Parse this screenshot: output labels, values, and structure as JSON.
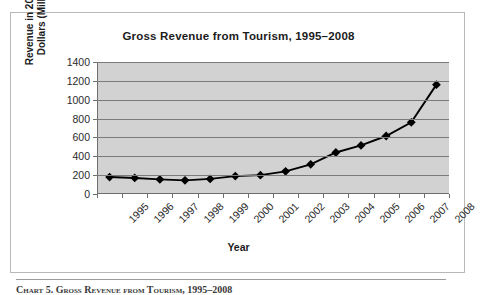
{
  "figure": {
    "title": "Gross Revenue from Tourism, 1995–2008",
    "x_axis_title": "Year",
    "y_axis_title_line1": "Revenue in 2010 U.S.",
    "y_axis_title_line2": "Dollars (Millions)",
    "footer_caption": "Chart 5.  Gross Revenue from Tourism, 1995–2008"
  },
  "colors": {
    "plot_background": "#d2d2d2",
    "gridline": "#7a7a7a",
    "axis": "#6e6e6e",
    "series": "#000000",
    "figure_border": "#b8b8b8",
    "title_text": "#1c1c1c"
  },
  "chart_data": {
    "type": "line",
    "title": "Gross Revenue from Tourism, 1995–2008",
    "xlabel": "Year",
    "ylabel": "Revenue in 2010 U.S. Dollars (Millions)",
    "categories": [
      "1995",
      "1996",
      "1997",
      "1998",
      "1999",
      "2000",
      "2001",
      "2002",
      "2003",
      "2004",
      "2005",
      "2006",
      "2007",
      "2008"
    ],
    "values": [
      180,
      170,
      155,
      145,
      160,
      190,
      200,
      240,
      315,
      440,
      515,
      615,
      760,
      1160
    ],
    "series": [
      {
        "name": "Gross Revenue",
        "values": [
          180,
          170,
          155,
          145,
          160,
          190,
          200,
          240,
          315,
          440,
          515,
          615,
          760,
          1160
        ]
      }
    ],
    "ylim": [
      0,
      1400
    ],
    "yticks": [
      0,
      200,
      400,
      600,
      800,
      1000,
      1200,
      1400
    ],
    "ytick_labels": [
      "0",
      "200",
      "400",
      "600",
      "800",
      "1000",
      "1200",
      "1400"
    ],
    "grid": true,
    "grid_axis": "y",
    "legend": false,
    "legend_position": "none",
    "marker": "diamond",
    "xtick_label_rotation": -45,
    "annotations": []
  }
}
